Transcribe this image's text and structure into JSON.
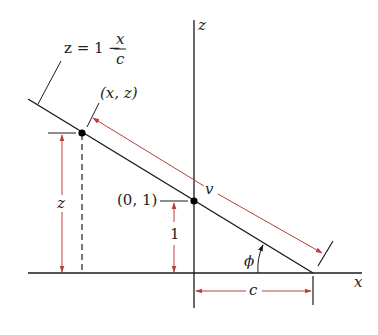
{
  "diagram": {
    "axes": {
      "x_label": "x",
      "z_label": "z"
    },
    "line_equation": {
      "lhs": "z = 1 −",
      "numerator": "x",
      "denominator": "c"
    },
    "points": {
      "general_point": "(x, z)",
      "intercept_point": "(0, 1)"
    },
    "dimensions": {
      "height_z": "z",
      "height_one": "1",
      "length_v": "v",
      "intercept_c": "c"
    },
    "angle": {
      "label": "ϕ"
    },
    "colors": {
      "line": "#1a1a1a",
      "dimension_red": "#b8403c",
      "point": "#000000"
    }
  }
}
